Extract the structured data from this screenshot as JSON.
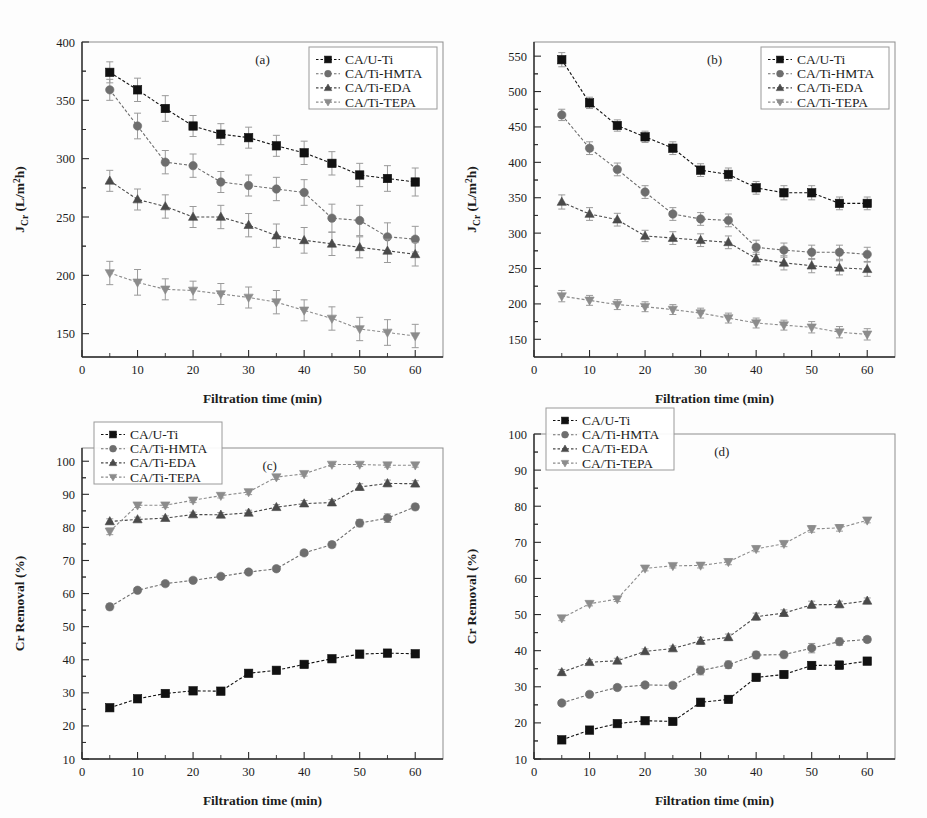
{
  "figure": {
    "background": "#fdfdfd",
    "series_colors": {
      "CA/U-Ti": "#111111",
      "CA/Ti-HMTA": "#6e6e6e",
      "CA/Ti-EDA": "#4a4a4a",
      "CA/Ti-TEPA": "#8c8c8c"
    },
    "series_markers": {
      "CA/U-Ti": "square",
      "CA/Ti-HMTA": "circle",
      "CA/Ti-EDA": "triangle-up",
      "CA/Ti-TEPA": "triangle-down"
    }
  },
  "panels": {
    "a": {
      "tag": "(a)"
    },
    "b": {
      "tag": "(b)"
    },
    "c": {
      "tag": "(c)"
    },
    "d": {
      "tag": "(d)"
    }
  },
  "chart_data": [
    {
      "type": "line",
      "panel": "a",
      "title": "(a)",
      "xlabel": "Filtration time (min)",
      "ylabel": "J_Cr (L/m²h)",
      "ylabel_parts": {
        "main": "J",
        "sub": "Cr",
        "unit_pre": " (L/m",
        "unit_sup": "2",
        "unit_post": "h)"
      },
      "x": [
        5,
        10,
        15,
        20,
        25,
        30,
        35,
        40,
        45,
        50,
        55,
        60
      ],
      "xlim": [
        0,
        65
      ],
      "ylim": [
        130,
        400
      ],
      "xticks": [
        0,
        10,
        20,
        30,
        40,
        50,
        60
      ],
      "yticks": [
        150,
        200,
        250,
        300,
        350,
        400
      ],
      "grid": false,
      "legend_position": "top-right",
      "series": [
        {
          "name": "CA/U-Ti",
          "values": [
            374,
            359,
            343,
            328,
            321,
            318,
            311,
            305,
            296,
            286,
            283,
            280
          ],
          "errors": [
            9,
            10,
            11,
            9,
            9,
            9,
            9,
            10,
            10,
            10,
            11,
            12
          ]
        },
        {
          "name": "CA/Ti-HMTA",
          "values": [
            359,
            328,
            297,
            294,
            280,
            277,
            274,
            271,
            249,
            247,
            233,
            231
          ],
          "errors": [
            9,
            11,
            10,
            10,
            9,
            9,
            10,
            11,
            12,
            13,
            12,
            11
          ]
        },
        {
          "name": "CA/Ti-EDA",
          "values": [
            281,
            265,
            259,
            250,
            250,
            243,
            234,
            230,
            227,
            224,
            221,
            218
          ],
          "errors": [
            9,
            9,
            10,
            9,
            10,
            10,
            10,
            11,
            10,
            9,
            10,
            10
          ]
        },
        {
          "name": "CA/Ti-TEPA",
          "values": [
            202,
            194,
            188,
            187,
            184,
            181,
            177,
            170,
            163,
            154,
            151,
            148
          ],
          "errors": [
            10,
            11,
            9,
            8,
            9,
            9,
            10,
            9,
            10,
            10,
            11,
            10
          ]
        }
      ]
    },
    {
      "type": "line",
      "panel": "b",
      "title": "(b)",
      "xlabel": "Filtration time (min)",
      "ylabel": "J_Cr (L/m²h)",
      "ylabel_parts": {
        "main": "J",
        "sub": "Cr",
        "unit_pre": " (L/m",
        "unit_sup": "2",
        "unit_post": "h)"
      },
      "x": [
        5,
        10,
        15,
        20,
        25,
        30,
        35,
        40,
        45,
        50,
        55,
        60
      ],
      "xlim": [
        0,
        65
      ],
      "ylim": [
        125,
        570
      ],
      "xticks": [
        0,
        10,
        20,
        30,
        40,
        50,
        60
      ],
      "yticks": [
        150,
        200,
        250,
        300,
        350,
        400,
        450,
        500,
        550
      ],
      "grid": false,
      "legend_position": "top-right",
      "series": [
        {
          "name": "CA/U-Ti",
          "values": [
            545,
            484,
            452,
            436,
            420,
            389,
            383,
            364,
            357,
            357,
            342,
            342
          ],
          "errors": [
            10,
            8,
            8,
            8,
            9,
            9,
            9,
            9,
            10,
            10,
            9,
            9
          ]
        },
        {
          "name": "CA/Ti-HMTA",
          "values": [
            467,
            420,
            390,
            358,
            327,
            320,
            318,
            280,
            276,
            273,
            273,
            270
          ],
          "errors": [
            8,
            9,
            9,
            9,
            9,
            9,
            9,
            10,
            10,
            10,
            10,
            10
          ]
        },
        {
          "name": "CA/Ti-EDA",
          "values": [
            344,
            327,
            319,
            296,
            293,
            290,
            287,
            264,
            258,
            254,
            251,
            249
          ],
          "errors": [
            10,
            9,
            9,
            8,
            9,
            9,
            9,
            9,
            10,
            10,
            10,
            10
          ]
        },
        {
          "name": "CA/Ti-TEPA",
          "values": [
            211,
            205,
            199,
            196,
            192,
            187,
            180,
            173,
            170,
            167,
            160,
            157
          ],
          "errors": [
            8,
            7,
            7,
            7,
            7,
            7,
            7,
            7,
            7,
            8,
            8,
            8
          ]
        }
      ]
    },
    {
      "type": "line",
      "panel": "c",
      "title": "(c)",
      "xlabel": "Filtration time (min)",
      "ylabel": "Cr Removal (%)",
      "x": [
        5,
        10,
        15,
        20,
        25,
        30,
        35,
        40,
        45,
        50,
        55,
        60
      ],
      "xlim": [
        0,
        65
      ],
      "ylim": [
        10,
        104
      ],
      "xticks": [
        0,
        10,
        20,
        30,
        40,
        50,
        60
      ],
      "yticks": [
        10,
        20,
        30,
        40,
        50,
        60,
        70,
        80,
        90,
        100
      ],
      "grid": false,
      "legend_position": "top-left",
      "series": [
        {
          "name": "CA/U-Ti",
          "values": [
            25.5,
            28.2,
            29.8,
            30.6,
            30.5,
            35.9,
            36.8,
            38.6,
            40.3,
            41.7,
            42.0,
            41.8
          ],
          "errors": [
            1.0,
            0.7,
            0.7,
            0.8,
            0.8,
            0.9,
            0.8,
            0.8,
            0.8,
            0.9,
            0.9,
            0.8
          ]
        },
        {
          "name": "CA/Ti-HMTA",
          "values": [
            56.0,
            61.0,
            63.0,
            64.0,
            65.2,
            66.5,
            67.5,
            72.3,
            74.8,
            81.3,
            82.8,
            86.2
          ],
          "errors": [
            0.9,
            0.7,
            0.7,
            0.7,
            0.7,
            0.8,
            0.8,
            0.8,
            0.9,
            1.1,
            1.3,
            0.9
          ]
        },
        {
          "name": "CA/Ti-EDA",
          "values": [
            81.8,
            82.4,
            82.8,
            83.9,
            83.8,
            84.4,
            86.1,
            87.2,
            87.5,
            92.2,
            93.3,
            93.2
          ],
          "errors": [
            0.8,
            0.7,
            0.7,
            0.7,
            0.7,
            0.8,
            0.8,
            0.9,
            0.9,
            1.0,
            1.0,
            0.9
          ]
        },
        {
          "name": "CA/Ti-TEPA",
          "values": [
            78.8,
            86.7,
            86.7,
            88.2,
            89.6,
            90.7,
            95.2,
            96.2,
            99.0,
            99.0,
            98.8,
            98.8
          ],
          "errors": [
            1.0,
            0.7,
            0.7,
            0.7,
            0.7,
            0.8,
            0.7,
            0.7,
            0.6,
            0.6,
            0.6,
            0.6
          ]
        }
      ]
    },
    {
      "type": "line",
      "panel": "d",
      "title": "(d)",
      "xlabel": "Filtration time (min)",
      "ylabel": "Cr  Removal (%)",
      "x": [
        5,
        10,
        15,
        20,
        25,
        30,
        35,
        40,
        45,
        50,
        55,
        60
      ],
      "xlim": [
        0,
        65
      ],
      "ylim": [
        10,
        100
      ],
      "xticks": [
        0,
        10,
        20,
        30,
        40,
        50,
        60
      ],
      "yticks": [
        10,
        20,
        30,
        40,
        50,
        60,
        70,
        80,
        90,
        100
      ],
      "grid": false,
      "legend_position": "top-left",
      "series": [
        {
          "name": "CA/U-Ti",
          "values": [
            15.3,
            18.0,
            19.8,
            20.6,
            20.4,
            25.7,
            26.5,
            32.6,
            33.4,
            35.9,
            36.0,
            37.1
          ],
          "errors": [
            0.7,
            0.7,
            0.7,
            0.7,
            0.7,
            1.1,
            1.0,
            1.0,
            1.0,
            1.1,
            1.1,
            0.8
          ]
        },
        {
          "name": "CA/Ti-HMTA",
          "values": [
            25.5,
            27.9,
            29.8,
            30.5,
            30.4,
            34.5,
            36.1,
            38.8,
            38.9,
            40.7,
            42.5,
            43.1
          ],
          "errors": [
            0.7,
            0.7,
            0.7,
            0.7,
            0.7,
            1.2,
            1.0,
            1.0,
            0.9,
            1.3,
            1.0,
            0.8
          ]
        },
        {
          "name": "CA/Ti-EDA",
          "values": [
            34.0,
            36.8,
            37.2,
            39.8,
            40.6,
            42.7,
            43.7,
            49.4,
            50.4,
            52.7,
            52.8,
            53.8
          ],
          "errors": [
            0.8,
            0.7,
            0.7,
            0.7,
            0.7,
            1.0,
            0.9,
            1.0,
            0.9,
            1.0,
            0.9,
            0.8
          ]
        },
        {
          "name": "CA/Ti-TEPA",
          "values": [
            49.0,
            53.0,
            54.3,
            62.8,
            63.5,
            63.6,
            64.6,
            68.2,
            69.6,
            73.7,
            74.0,
            76.1
          ],
          "errors": [
            0.7,
            0.6,
            0.7,
            0.7,
            0.6,
            0.7,
            0.8,
            0.8,
            0.8,
            0.9,
            0.9,
            0.7
          ]
        }
      ]
    }
  ],
  "legend": {
    "entries": [
      "CA/U-Ti",
      "CA/Ti-HMTA",
      "CA/Ti-EDA",
      "CA/Ti-TEPA"
    ]
  }
}
